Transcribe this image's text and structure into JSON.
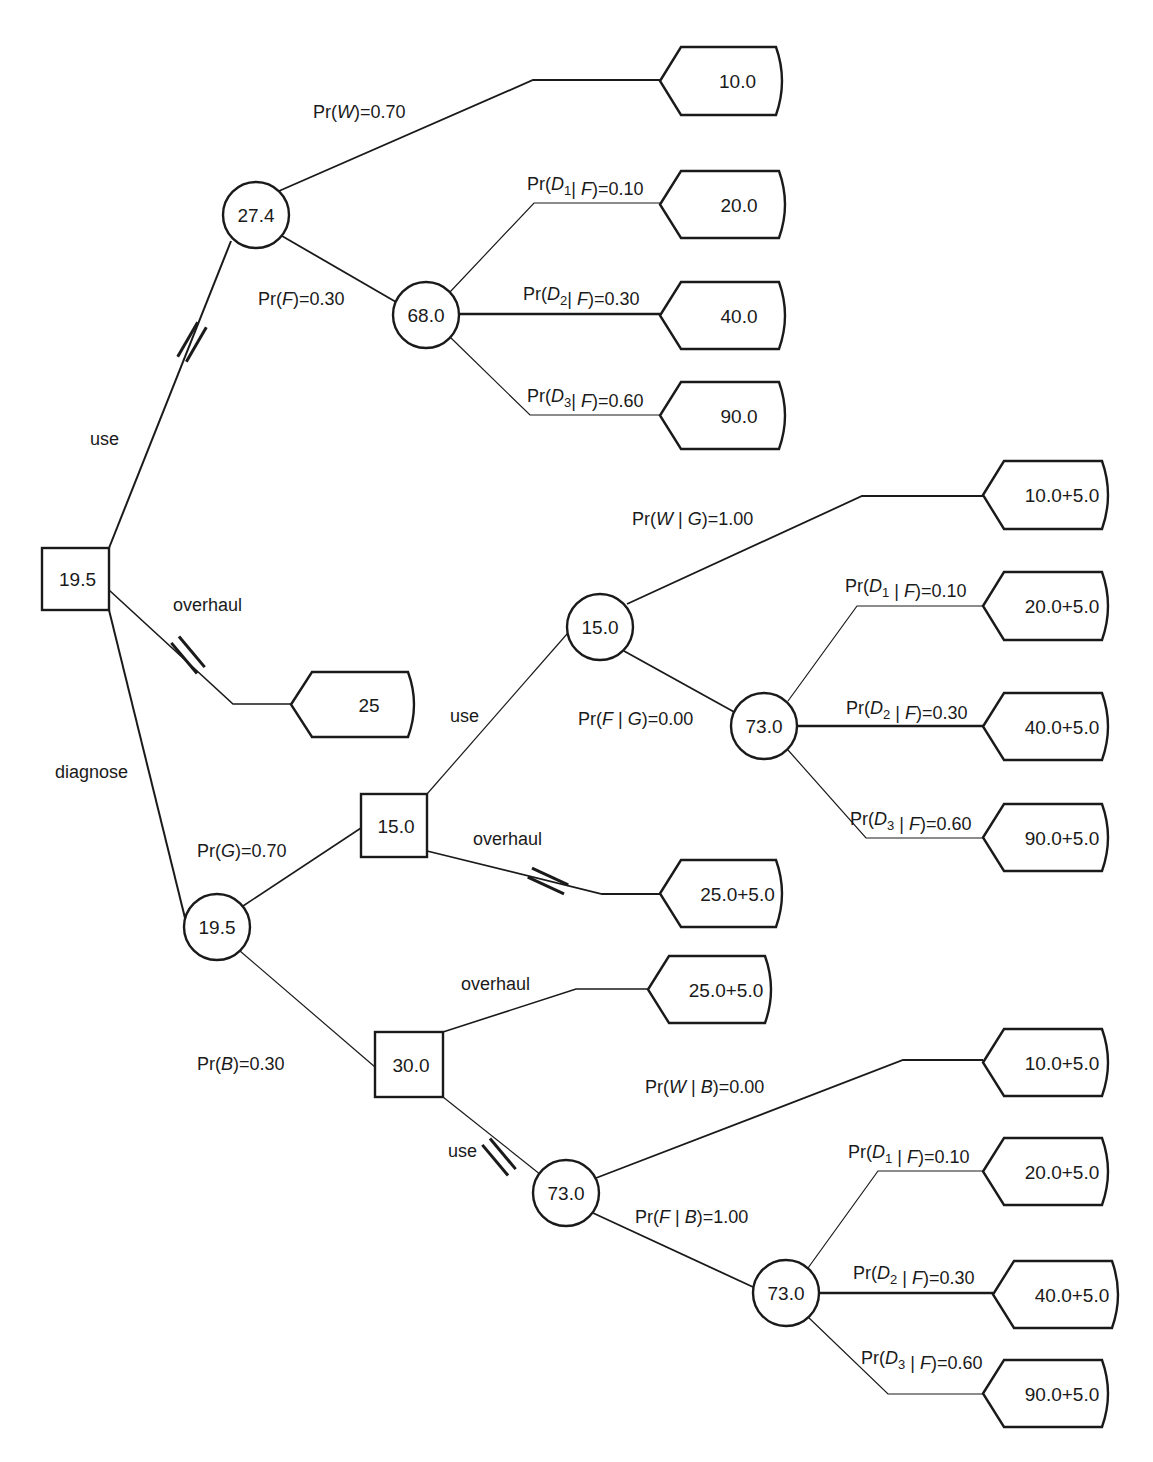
{
  "diagram": {
    "title": "",
    "type": "decision-tree",
    "colors": {
      "line": "#1a1a1a",
      "background": "#ffffff"
    },
    "decision_nodes": [
      {
        "id": "root",
        "value": "19.5",
        "x": 42,
        "y": 548,
        "w": 67,
        "h": 62
      },
      {
        "id": "after-good",
        "value": "15.0",
        "x": 361,
        "y": 794,
        "w": 66,
        "h": 63
      },
      {
        "id": "after-bad",
        "value": "30.0",
        "x": 375,
        "y": 1032,
        "w": 68,
        "h": 65
      }
    ],
    "chance_nodes": [
      {
        "id": "use-state",
        "value": "27.4",
        "cx": 256,
        "cy": 215,
        "r": 33
      },
      {
        "id": "use-failure",
        "value": "68.0",
        "cx": 426,
        "cy": 315,
        "r": 33
      },
      {
        "id": "diagnose-result",
        "value": "19.5",
        "cx": 217,
        "cy": 927,
        "r": 33
      },
      {
        "id": "good-use-state",
        "value": "15.0",
        "cx": 600,
        "cy": 627,
        "r": 33
      },
      {
        "id": "good-use-failure",
        "value": "73.0",
        "cx": 764,
        "cy": 726,
        "r": 33
      },
      {
        "id": "bad-use-state",
        "value": "73.0",
        "cx": 566,
        "cy": 1193,
        "r": 33
      },
      {
        "id": "bad-use-failure",
        "value": "73.0",
        "cx": 786,
        "cy": 1293,
        "r": 33
      }
    ],
    "terminals": [
      {
        "id": "t-use-W",
        "value": "10.0",
        "tip_x": 660,
        "y_top": 47,
        "y_bot": 115,
        "right": 782
      },
      {
        "id": "t-use-D1",
        "value": "20.0",
        "tip_x": 660,
        "y_top": 171,
        "y_bot": 238,
        "right": 785
      },
      {
        "id": "t-use-D2",
        "value": "40.0",
        "tip_x": 660,
        "y_top": 282,
        "y_bot": 349,
        "right": 785
      },
      {
        "id": "t-use-D3",
        "value": "90.0",
        "tip_x": 660,
        "y_top": 382,
        "y_bot": 449,
        "right": 785
      },
      {
        "id": "t-overhaul",
        "value": "25",
        "tip_x": 291,
        "y_top": 672,
        "y_bot": 737,
        "right": 414
      },
      {
        "id": "t-good-W",
        "value": "10.0+5.0",
        "tip_x": 983,
        "y_top": 461,
        "y_bot": 529,
        "right": 1108
      },
      {
        "id": "t-good-D1",
        "value": "20.0+5.0",
        "tip_x": 983,
        "y_top": 572,
        "y_bot": 640,
        "right": 1108
      },
      {
        "id": "t-good-D2",
        "value": "40.0+5.0",
        "tip_x": 983,
        "y_top": 693,
        "y_bot": 760,
        "right": 1108
      },
      {
        "id": "t-good-D3",
        "value": "90.0+5.0",
        "tip_x": 983,
        "y_top": 804,
        "y_bot": 871,
        "right": 1108
      },
      {
        "id": "t-good-overhaul",
        "value": "25.0+5.0",
        "tip_x": 660,
        "y_top": 860,
        "y_bot": 927,
        "right": 782
      },
      {
        "id": "t-bad-overhaul",
        "value": "25.0+5.0",
        "tip_x": 648,
        "y_top": 956,
        "y_bot": 1023,
        "right": 771
      },
      {
        "id": "t-bad-W",
        "value": "10.0+5.0",
        "tip_x": 983,
        "y_top": 1029,
        "y_bot": 1096,
        "right": 1108
      },
      {
        "id": "t-bad-D1",
        "value": "20.0+5.0",
        "tip_x": 983,
        "y_top": 1138,
        "y_bot": 1205,
        "right": 1108
      },
      {
        "id": "t-bad-D2",
        "value": "40.0+5.0",
        "tip_x": 993,
        "y_top": 1261,
        "y_bot": 1328,
        "right": 1118
      },
      {
        "id": "t-bad-D3",
        "value": "90.0+5.0",
        "tip_x": 983,
        "y_top": 1360,
        "y_bot": 1427,
        "right": 1108
      }
    ],
    "edges": [
      {
        "id": "e-root-use",
        "points": [
          [
            109,
            548
          ],
          [
            231,
            241
          ]
        ],
        "w": 2
      },
      {
        "id": "e-root-overhaul",
        "points": [
          [
            109,
            590
          ],
          [
            233,
            704
          ],
          [
            291,
            704
          ]
        ],
        "w": 1.6
      },
      {
        "id": "e-root-diagnose",
        "points": [
          [
            109,
            610
          ],
          [
            185,
            918
          ]
        ],
        "w": 2
      },
      {
        "id": "e-use-W",
        "points": [
          [
            279,
            191
          ],
          [
            533,
            80
          ],
          [
            660,
            80
          ]
        ],
        "w": 1.8
      },
      {
        "id": "e-use-F",
        "points": [
          [
            282,
            236
          ],
          [
            396,
            302
          ]
        ],
        "w": 1.8
      },
      {
        "id": "e-F-D1",
        "points": [
          [
            450,
            292
          ],
          [
            534,
            203
          ],
          [
            660,
            203
          ]
        ],
        "w": 1.2
      },
      {
        "id": "e-F-D2",
        "points": [
          [
            459,
            314
          ],
          [
            660,
            314
          ]
        ],
        "w": 2.4
      },
      {
        "id": "e-F-D3",
        "points": [
          [
            450,
            337
          ],
          [
            530,
            415
          ],
          [
            660,
            415
          ]
        ],
        "w": 1.2
      },
      {
        "id": "e-diag-good",
        "points": [
          [
            243,
            906
          ],
          [
            361,
            828
          ]
        ],
        "w": 1.6
      },
      {
        "id": "e-diag-bad",
        "points": [
          [
            240,
            951
          ],
          [
            375,
            1067
          ]
        ],
        "w": 1.2
      },
      {
        "id": "e-good-use",
        "points": [
          [
            427,
            794
          ],
          [
            567,
            634
          ]
        ],
        "w": 1.2
      },
      {
        "id": "e-good-overhaul",
        "points": [
          [
            427,
            851
          ],
          [
            602,
            894
          ],
          [
            660,
            894
          ]
        ],
        "w": 1.8
      },
      {
        "id": "e-gus-W",
        "points": [
          [
            627,
            604
          ],
          [
            862,
            496
          ],
          [
            983,
            496
          ]
        ],
        "w": 1.8
      },
      {
        "id": "e-gus-F",
        "points": [
          [
            624,
            651
          ],
          [
            736,
            713
          ]
        ],
        "w": 1.8
      },
      {
        "id": "e-guf-D1",
        "points": [
          [
            788,
            701
          ],
          [
            857,
            606
          ],
          [
            983,
            606
          ]
        ],
        "w": 1.2
      },
      {
        "id": "e-guf-D2",
        "points": [
          [
            797,
            726
          ],
          [
            983,
            726
          ]
        ],
        "w": 2.4
      },
      {
        "id": "e-guf-D3",
        "points": [
          [
            788,
            750
          ],
          [
            866,
            838
          ],
          [
            983,
            838
          ]
        ],
        "w": 1.2
      },
      {
        "id": "e-bad-overhaul",
        "points": [
          [
            443,
            1032
          ],
          [
            576,
            989
          ],
          [
            648,
            989
          ]
        ],
        "w": 1.6
      },
      {
        "id": "e-bad-use",
        "points": [
          [
            443,
            1097
          ],
          [
            541,
            1175
          ]
        ],
        "w": 1.2
      },
      {
        "id": "e-bus-W",
        "points": [
          [
            596,
            1178
          ],
          [
            903,
            1060
          ],
          [
            983,
            1060
          ]
        ],
        "w": 1.8
      },
      {
        "id": "e-bus-F",
        "points": [
          [
            593,
            1213
          ],
          [
            753,
            1287
          ]
        ],
        "w": 1.8
      },
      {
        "id": "e-buf-D1",
        "points": [
          [
            808,
            1268
          ],
          [
            878,
            1171
          ],
          [
            983,
            1171
          ]
        ],
        "w": 1.2
      },
      {
        "id": "e-buf-D2",
        "points": [
          [
            819,
            1293
          ],
          [
            993,
            1293
          ]
        ],
        "w": 2.4
      },
      {
        "id": "e-buf-D3",
        "points": [
          [
            808,
            1317
          ],
          [
            888,
            1394
          ],
          [
            983,
            1394
          ]
        ],
        "w": 1.2
      }
    ],
    "blocked_marks": [
      {
        "id": "hash-root-use",
        "x": 192,
        "y": 342,
        "angle": 30
      },
      {
        "id": "hash-root-overhaul",
        "x": 188,
        "y": 655,
        "angle": -40
      },
      {
        "id": "hash-good-overhaul",
        "x": 548,
        "y": 881,
        "angle": -65
      },
      {
        "id": "hash-bad-use",
        "x": 499,
        "y": 1157,
        "angle": -40
      }
    ],
    "labels": [
      {
        "id": "lbl-root-use",
        "x": 90,
        "y": 445,
        "parts": [
          [
            "use",
            ""
          ]
        ]
      },
      {
        "id": "lbl-root-overhaul",
        "x": 173,
        "y": 611,
        "parts": [
          [
            "overhaul",
            ""
          ]
        ]
      },
      {
        "id": "lbl-root-diagnose",
        "x": 55,
        "y": 778,
        "parts": [
          [
            "diagnose",
            ""
          ]
        ]
      },
      {
        "id": "lbl-prW",
        "x": 313,
        "y": 118,
        "parts": [
          [
            "Pr(",
            ""
          ],
          [
            "W",
            "it"
          ],
          [
            ")=0.70",
            ""
          ]
        ]
      },
      {
        "id": "lbl-prF",
        "x": 258,
        "y": 305,
        "parts": [
          [
            "Pr(",
            ""
          ],
          [
            "F",
            "it"
          ],
          [
            ")=0.30",
            ""
          ]
        ]
      },
      {
        "id": "lbl-use-D1",
        "x": 527,
        "y": 190,
        "parts": [
          [
            "Pr(",
            ""
          ],
          [
            "D",
            "it"
          ],
          [
            "1",
            "sub"
          ],
          [
            "| ",
            ""
          ],
          [
            "F",
            "it"
          ],
          [
            ")=0.10",
            ""
          ]
        ]
      },
      {
        "id": "lbl-use-D2",
        "x": 523,
        "y": 300,
        "parts": [
          [
            "Pr(",
            ""
          ],
          [
            "D",
            "it"
          ],
          [
            "2",
            "sub"
          ],
          [
            "| ",
            ""
          ],
          [
            "F",
            "it"
          ],
          [
            ")=0.30",
            ""
          ]
        ]
      },
      {
        "id": "lbl-use-D3",
        "x": 527,
        "y": 402,
        "parts": [
          [
            "Pr(",
            ""
          ],
          [
            "D",
            "it"
          ],
          [
            "3",
            "sub"
          ],
          [
            "| ",
            ""
          ],
          [
            "F",
            "it"
          ],
          [
            ")=0.60",
            ""
          ]
        ]
      },
      {
        "id": "lbl-prG",
        "x": 197,
        "y": 857,
        "parts": [
          [
            "Pr(",
            ""
          ],
          [
            "G",
            "it"
          ],
          [
            ")=0.70",
            ""
          ]
        ]
      },
      {
        "id": "lbl-prB",
        "x": 197,
        "y": 1070,
        "parts": [
          [
            "Pr(",
            ""
          ],
          [
            "B",
            "it"
          ],
          [
            ")=0.30",
            ""
          ]
        ]
      },
      {
        "id": "lbl-good-use",
        "x": 450,
        "y": 722,
        "parts": [
          [
            "use",
            ""
          ]
        ]
      },
      {
        "id": "lbl-good-overhaul",
        "x": 473,
        "y": 845,
        "parts": [
          [
            "overhaul",
            ""
          ]
        ]
      },
      {
        "id": "lbl-prWG",
        "x": 632,
        "y": 525,
        "parts": [
          [
            "Pr(",
            ""
          ],
          [
            "W",
            "it"
          ],
          [
            " | ",
            ""
          ],
          [
            "G",
            "it"
          ],
          [
            ")=1.00",
            ""
          ]
        ]
      },
      {
        "id": "lbl-prFG",
        "x": 578,
        "y": 725,
        "parts": [
          [
            "Pr(",
            ""
          ],
          [
            "F",
            "it"
          ],
          [
            " | ",
            ""
          ],
          [
            "G",
            "it"
          ],
          [
            ")=0.00",
            ""
          ]
        ]
      },
      {
        "id": "lbl-good-D1",
        "x": 845,
        "y": 592,
        "parts": [
          [
            "Pr(",
            ""
          ],
          [
            "D",
            "it"
          ],
          [
            "1",
            "sub"
          ],
          [
            " | ",
            ""
          ],
          [
            "F",
            "it"
          ],
          [
            ")=0.10",
            ""
          ]
        ]
      },
      {
        "id": "lbl-good-D2",
        "x": 846,
        "y": 714,
        "parts": [
          [
            "Pr(",
            ""
          ],
          [
            "D",
            "it"
          ],
          [
            "2",
            "sub"
          ],
          [
            " | ",
            ""
          ],
          [
            "F",
            "it"
          ],
          [
            ")=0.30",
            ""
          ]
        ]
      },
      {
        "id": "lbl-good-D3",
        "x": 850,
        "y": 825,
        "parts": [
          [
            "Pr(",
            ""
          ],
          [
            "D",
            "it"
          ],
          [
            "3",
            "sub"
          ],
          [
            " | ",
            ""
          ],
          [
            "F",
            "it"
          ],
          [
            ")=0.60",
            ""
          ]
        ]
      },
      {
        "id": "lbl-bad-overhaul",
        "x": 461,
        "y": 990,
        "parts": [
          [
            "overhaul",
            ""
          ]
        ]
      },
      {
        "id": "lbl-bad-use",
        "x": 448,
        "y": 1157,
        "parts": [
          [
            "use",
            ""
          ]
        ]
      },
      {
        "id": "lbl-prWB",
        "x": 645,
        "y": 1093,
        "parts": [
          [
            "Pr(",
            ""
          ],
          [
            "W",
            "it"
          ],
          [
            " | ",
            ""
          ],
          [
            "B",
            "it"
          ],
          [
            ")=0.00",
            ""
          ]
        ]
      },
      {
        "id": "lbl-prFB",
        "x": 635,
        "y": 1223,
        "parts": [
          [
            "Pr(",
            ""
          ],
          [
            "F",
            "it"
          ],
          [
            " | ",
            ""
          ],
          [
            "B",
            "it"
          ],
          [
            ")=1.00",
            ""
          ]
        ]
      },
      {
        "id": "lbl-bad-D1",
        "x": 848,
        "y": 1158,
        "parts": [
          [
            "Pr(",
            ""
          ],
          [
            "D",
            "it"
          ],
          [
            "1",
            "sub"
          ],
          [
            " | ",
            ""
          ],
          [
            "F",
            "it"
          ],
          [
            ")=0.10",
            ""
          ]
        ]
      },
      {
        "id": "lbl-bad-D2",
        "x": 853,
        "y": 1279,
        "parts": [
          [
            "Pr(",
            ""
          ],
          [
            "D",
            "it"
          ],
          [
            "2",
            "sub"
          ],
          [
            " | ",
            ""
          ],
          [
            "F",
            "it"
          ],
          [
            ")=0.30",
            ""
          ]
        ]
      },
      {
        "id": "lbl-bad-D3",
        "x": 861,
        "y": 1364,
        "parts": [
          [
            "Pr(",
            ""
          ],
          [
            "D",
            "it"
          ],
          [
            "3",
            "sub"
          ],
          [
            " | ",
            ""
          ],
          [
            "F",
            "it"
          ],
          [
            ")=0.60",
            ""
          ]
        ]
      }
    ]
  }
}
